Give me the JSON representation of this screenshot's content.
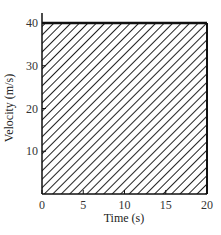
{
  "chart_data": {
    "type": "area",
    "title": "",
    "xlabel": "Time (s)",
    "ylabel": "Velocity (m/s)",
    "xlim": [
      0,
      20
    ],
    "ylim": [
      0,
      40
    ],
    "x_ticks": [
      0,
      5,
      10,
      15,
      20
    ],
    "y_ticks": [
      10,
      20,
      30,
      40
    ],
    "x_tick_labels": [
      "0",
      "5",
      "10",
      "15",
      "20"
    ],
    "y_tick_labels": [
      "10",
      "20",
      "30",
      "40"
    ],
    "grid": false,
    "legend": null,
    "fill": "diagonal-hatch",
    "series": [
      {
        "name": "velocity",
        "x": [
          0,
          20
        ],
        "y": [
          40,
          40
        ]
      }
    ],
    "annotations": []
  },
  "axes": {
    "x_label": "Time (s)",
    "y_label": "Velocity (m/s)",
    "x_ticks": [
      "0",
      "5",
      "10",
      "15",
      "20"
    ],
    "y_ticks": [
      "10",
      "20",
      "30",
      "40"
    ]
  },
  "colors": {
    "line": "#111111",
    "hatch": "#222222",
    "background": "#ffffff"
  }
}
